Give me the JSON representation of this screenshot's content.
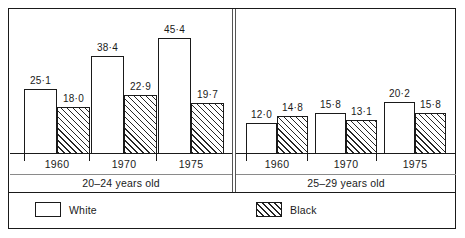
{
  "chart_data": {
    "type": "bar",
    "title": "",
    "subtitle": "",
    "xlabel": "",
    "ylabel": "",
    "grid": false,
    "legend_position": "bottom",
    "value_decimal_separator": "·",
    "ylim": [
      0,
      50
    ],
    "panels": [
      {
        "caption": "20–24 years old",
        "categories": [
          "1960",
          "1970",
          "1975"
        ],
        "series": [
          {
            "name": "White",
            "values": [
              25.1,
              18.0,
              38.4
            ],
            "style": "open"
          },
          {
            "name": "Black",
            "values": [
              22.9,
              45.4,
              19.7
            ],
            "style": "hatched"
          }
        ],
        "groups": [
          {
            "year": "1960",
            "bars": [
              {
                "series": "White",
                "value": 25.1,
                "display": "25·1",
                "style": "open"
              },
              {
                "series": "Black",
                "value": 18.0,
                "display": "18·0",
                "style": "hatched"
              }
            ]
          },
          {
            "year": "1970",
            "bars": [
              {
                "series": "White",
                "value": 38.4,
                "display": "38·4",
                "style": "open"
              },
              {
                "series": "Black",
                "value": 22.9,
                "display": "22·9",
                "style": "hatched"
              }
            ]
          },
          {
            "year": "1975",
            "bars": [
              {
                "series": "White",
                "value": 45.4,
                "display": "45·4",
                "style": "open"
              },
              {
                "series": "Black",
                "value": 19.7,
                "display": "19·7",
                "style": "hatched"
              }
            ]
          }
        ]
      },
      {
        "caption": "25–29 years old",
        "categories": [
          "1960",
          "1970",
          "1975"
        ],
        "series": [
          {
            "name": "White",
            "values": [
              12.0,
              15.8,
              20.2
            ],
            "style": "open"
          },
          {
            "name": "Black",
            "values": [
              14.8,
              13.1,
              15.8
            ],
            "style": "hatched"
          }
        ],
        "groups": [
          {
            "year": "1960",
            "bars": [
              {
                "series": "White",
                "value": 12.0,
                "display": "12·0",
                "style": "open"
              },
              {
                "series": "Black",
                "value": 14.8,
                "display": "14·8",
                "style": "hatched"
              }
            ]
          },
          {
            "year": "1970",
            "bars": [
              {
                "series": "White",
                "value": 15.8,
                "display": "15·8",
                "style": "open"
              },
              {
                "series": "Black",
                "value": 13.1,
                "display": "13·1",
                "style": "hatched"
              }
            ]
          },
          {
            "year": "1975",
            "bars": [
              {
                "series": "White",
                "value": 20.2,
                "display": "20·2",
                "style": "open"
              },
              {
                "series": "Black",
                "value": 15.8,
                "display": "15·8",
                "style": "hatched"
              }
            ]
          }
        ]
      }
    ],
    "legend": [
      {
        "label": "White",
        "style": "open"
      },
      {
        "label": "Black",
        "style": "hatched"
      }
    ]
  },
  "colors": {
    "ink": "#1a1a1a",
    "rule": "#8a8a8a",
    "background": "#ffffff",
    "hatch": "#262626"
  }
}
